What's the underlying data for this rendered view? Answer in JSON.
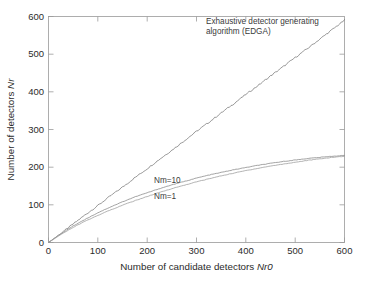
{
  "figure": {
    "background_color": "#ffffff",
    "frame_color": "#9a9a9a",
    "width": 365,
    "height": 281
  },
  "chart_data": {
    "type": "line",
    "title": "",
    "subtitle": "",
    "xlabel": "Number of candidate detectors Nr0",
    "xlabel_plain": "Number of candidate detectors ",
    "xlabel_italic": "Nr0",
    "ylabel": "Number of detectors Nr",
    "ylabel_plain": "Number of detectors ",
    "ylabel_italic": "Nr",
    "xlim": [
      0,
      600
    ],
    "ylim": [
      0,
      600
    ],
    "xticks": [
      0,
      100,
      200,
      300,
      400,
      500,
      600
    ],
    "yticks": [
      0,
      100,
      200,
      300,
      400,
      500,
      600
    ],
    "xtick_labels": [
      "0",
      "100",
      "200",
      "300",
      "400",
      "500",
      "600"
    ],
    "ytick_labels": [
      "0",
      "100",
      "200",
      "300",
      "400",
      "500",
      "600"
    ],
    "grid": false,
    "legend_position": "inline-annotations",
    "tick_direction": "in",
    "series": [
      {
        "name": "Exhaustive detector generating algorithm (EDGA)",
        "short_name": "EDGA",
        "color": "#6e6e6e",
        "line_width": 0.7,
        "x": [
          0,
          25,
          50,
          75,
          100,
          125,
          150,
          175,
          200,
          225,
          250,
          275,
          300,
          325,
          350,
          375,
          400,
          425,
          450,
          475,
          500,
          525,
          550,
          575,
          600
        ],
        "values": [
          0,
          24,
          49,
          74,
          98,
          123,
          147,
          172,
          196,
          221,
          245,
          270,
          295,
          319,
          344,
          368,
          393,
          417,
          442,
          466,
          491,
          515,
          540,
          565,
          590
        ]
      },
      {
        "name": "Nm=10",
        "short_name": "Nm=10",
        "color": "#8c8c8c",
        "line_width": 0.8,
        "x": [
          0,
          25,
          50,
          75,
          100,
          125,
          150,
          175,
          200,
          225,
          250,
          275,
          300,
          325,
          350,
          375,
          400,
          425,
          450,
          475,
          500,
          525,
          550,
          575,
          600
        ],
        "values": [
          0,
          23,
          44,
          62,
          79,
          94,
          108,
          121,
          132,
          143,
          153,
          162,
          171,
          179,
          186,
          193,
          199,
          205,
          210,
          215,
          219,
          223,
          226,
          229,
          231
        ]
      },
      {
        "name": "Nm=1",
        "short_name": "Nm=1",
        "color": "#a0a0a0",
        "line_width": 0.8,
        "x": [
          0,
          25,
          50,
          75,
          100,
          125,
          150,
          175,
          200,
          225,
          250,
          275,
          300,
          325,
          350,
          375,
          400,
          425,
          450,
          475,
          500,
          525,
          550,
          575,
          600
        ],
        "values": [
          0,
          21,
          40,
          57,
          72,
          86,
          99,
          111,
          122,
          133,
          143,
          152,
          161,
          169,
          177,
          184,
          191,
          197,
          203,
          208,
          213,
          218,
          222,
          226,
          229
        ]
      }
    ],
    "annotations": [
      {
        "id": "edga-annotation",
        "line1": "Exhaustive detector generating",
        "line2": "algorithm (EDGA)",
        "x": 600,
        "y": 600
      },
      {
        "id": "nm10-label",
        "text": "Nm=10",
        "x": 230,
        "y": 170
      },
      {
        "id": "nm1-label",
        "text": "Nm=1",
        "x": 230,
        "y": 125
      }
    ]
  }
}
